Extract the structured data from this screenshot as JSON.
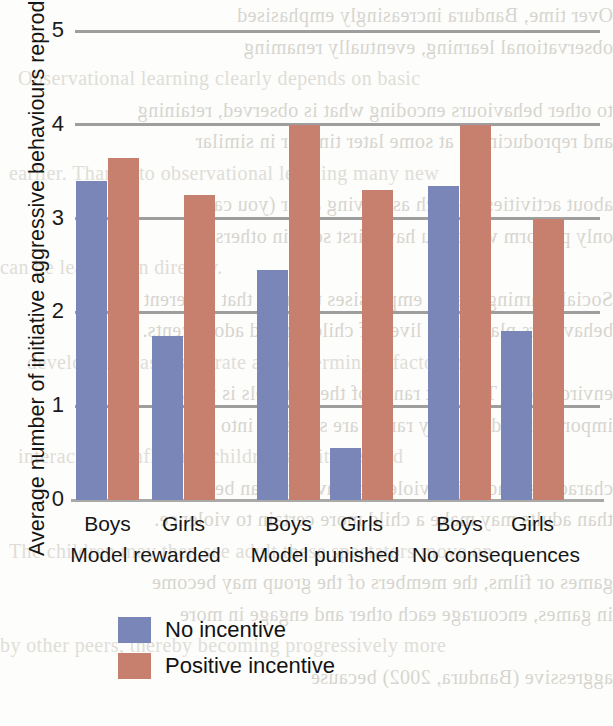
{
  "chart_data": {
    "type": "bar",
    "title": "",
    "xlabel": "",
    "ylabel": "Average number of initiative aggressive behaviours reproduced",
    "ylim": [
      0,
      5
    ],
    "yticks": [
      0,
      1,
      2,
      3,
      4,
      5
    ],
    "ytick_labels": [
      "0",
      "1",
      "2",
      "3",
      "4",
      "5"
    ],
    "grid": true,
    "legend_position": "bottom-left",
    "groups": [
      {
        "label": "Model rewarded",
        "categories": [
          "Boys",
          "Girls"
        ]
      },
      {
        "label": "Model punished",
        "categories": [
          "Boys",
          "Girls"
        ]
      },
      {
        "label": "No consequences",
        "categories": [
          "Boys",
          "Girls"
        ]
      }
    ],
    "categories": [
      "Model rewarded / Boys",
      "Model rewarded / Girls",
      "Model punished / Boys",
      "Model punished / Girls",
      "No consequences / Boys",
      "No consequences / Girls"
    ],
    "series": [
      {
        "name": "No incentive",
        "color": "#7b86b8",
        "values": [
          3.4,
          1.75,
          2.45,
          0.55,
          3.35,
          1.8
        ]
      },
      {
        "name": "Positive incentive",
        "color": "#c8806e",
        "values": [
          3.65,
          3.25,
          4.0,
          3.3,
          4.0,
          3.0
        ]
      }
    ]
  },
  "legend": {
    "items": [
      {
        "label": "No incentive",
        "color": "#7b86b8"
      },
      {
        "label": "Positive incentive",
        "color": "#c8806e"
      }
    ]
  },
  "background_text": {
    "lines": [
      "Over time, Bandura increasingly emphasised",
      "observational learning, eventually renaming",
      "Observational learning clearly depends on basic",
      "to other behaviours encoding what is observed, retaining",
      "and reproducing it at some later time or in similar",
      "earlier. Thanks to observational learning many new",
      "about activities — such as driving a car (you can",
      "only perform what you have first seen in others)",
      "can be learnt than directly.",
      "Social learning theory emphasises the role that different",
      "behaviours play in the lives of children and adolescents.",
      "development as a separate and determinant factor in",
      "environment. The vast range of their models is very",
      "important, and yet they rarely are students into their",
      "interactions, influence children's attitudes and",
      "characters who enjoy violent behaviours can be more",
      "than adults may make a child more certain to violence.",
      "The children may then see adult these spectators move on",
      "games or films, the members of the group may become",
      "in games, encourage each other and engage in more",
      "by other peers, thereby becoming progressively more",
      "aggressive (Bandura, 2002) because"
    ]
  }
}
